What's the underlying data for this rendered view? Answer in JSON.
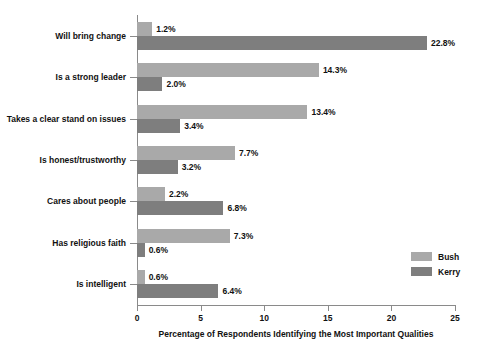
{
  "chart_data": {
    "type": "bar",
    "orientation": "horizontal",
    "title": "",
    "xlabel": "Percentage of Respondents Identifying the Most Important Qualities",
    "ylabel": "",
    "xlim": [
      0,
      25
    ],
    "xticks": [
      0,
      5,
      10,
      15,
      20,
      25
    ],
    "grid": false,
    "legend_position": "right-inside",
    "categories": [
      "Will bring change",
      "Is a strong leader",
      "Takes a clear stand on issues",
      "Is honest/trustworthy",
      "Cares about people",
      "Has religious faith",
      "Is intelligent"
    ],
    "series": [
      {
        "name": "Bush",
        "color": "#a9a9a9",
        "values": [
          1.2,
          14.3,
          13.4,
          7.7,
          2.2,
          7.3,
          0.6
        ],
        "labels": [
          "1.2%",
          "14.3%",
          "13.4%",
          "7.7%",
          "2.2%",
          "7.3%",
          "0.6%"
        ]
      },
      {
        "name": "Kerry",
        "color": "#7e7e7e",
        "values": [
          22.8,
          2.0,
          3.4,
          3.2,
          6.8,
          0.6,
          6.4
        ],
        "labels": [
          "22.8%",
          "2.0%",
          "3.4%",
          "3.2%",
          "6.8%",
          "0.6%",
          "6.4%"
        ]
      }
    ]
  },
  "legend": {
    "items": [
      {
        "label": "Bush",
        "color": "#a9a9a9"
      },
      {
        "label": "Kerry",
        "color": "#7e7e7e"
      }
    ]
  },
  "colors": {
    "background": "#ffffff",
    "axis": "#8a8a8a",
    "text": "#111111",
    "bush": "#a9a9a9",
    "kerry": "#7e7e7e"
  }
}
